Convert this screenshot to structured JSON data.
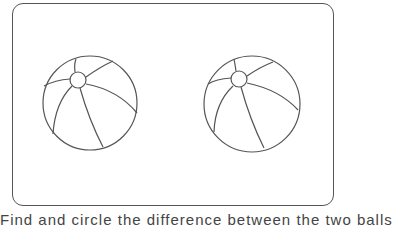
{
  "worksheet": {
    "caption": "Find and circle the difference between the two balls",
    "stroke_color": "#555555",
    "items": [
      {
        "name": "left-beach-ball"
      },
      {
        "name": "right-beach-ball"
      }
    ]
  }
}
